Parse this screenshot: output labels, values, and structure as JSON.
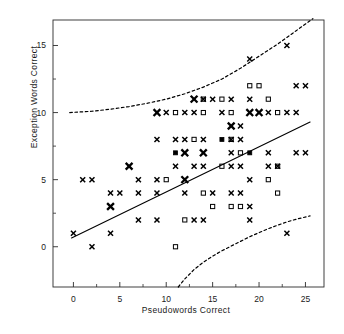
{
  "chart_data": {
    "type": "scatter",
    "title": "",
    "xlabel": "Pseudowords Correct",
    "ylabel": "Exception Words Correct",
    "xlim": [
      -2.2,
      27.0
    ],
    "ylim": [
      -3.0,
      16.9
    ],
    "xticks": [
      0,
      5,
      10,
      15,
      20,
      25
    ],
    "yticks": [
      0,
      5,
      10,
      15
    ],
    "xminorticks": [
      2.5,
      7.5,
      12.5,
      17.5,
      22.5
    ],
    "yminorticks": [
      2.5,
      7.5,
      12.5
    ],
    "grid": false,
    "legend": "none",
    "marker_colors": {
      "cross": "#000000",
      "square": "#000000"
    },
    "series": [
      {
        "name": "cross",
        "marker": "x",
        "points": [
          [
            0,
            1
          ],
          [
            4,
            1
          ],
          [
            23,
            1
          ],
          [
            2,
            0
          ],
          [
            7,
            2
          ],
          [
            9,
            2
          ],
          [
            13,
            2
          ],
          [
            14,
            2
          ],
          [
            19,
            2
          ],
          [
            4,
            3
          ],
          [
            19,
            3
          ],
          [
            4,
            4
          ],
          [
            5,
            4
          ],
          [
            7,
            4
          ],
          [
            9,
            4
          ],
          [
            12,
            4
          ],
          [
            15,
            4
          ],
          [
            17,
            4
          ],
          [
            18,
            4
          ],
          [
            1,
            5
          ],
          [
            2,
            5
          ],
          [
            7,
            5
          ],
          [
            9,
            5
          ],
          [
            12,
            5
          ],
          [
            19,
            5
          ],
          [
            6,
            6
          ],
          [
            11,
            6
          ],
          [
            13,
            6
          ],
          [
            14,
            6
          ],
          [
            17,
            6
          ],
          [
            18,
            6
          ],
          [
            21,
            6
          ],
          [
            22,
            6
          ],
          [
            12,
            7
          ],
          [
            14,
            7
          ],
          [
            17,
            7
          ],
          [
            21,
            7
          ],
          [
            24,
            7
          ],
          [
            25,
            7
          ],
          [
            9,
            8
          ],
          [
            11,
            8
          ],
          [
            12,
            8
          ],
          [
            14,
            8
          ],
          [
            17,
            8
          ],
          [
            18,
            8
          ],
          [
            17,
            9
          ],
          [
            18,
            9
          ],
          [
            9,
            10
          ],
          [
            10,
            10
          ],
          [
            12,
            10
          ],
          [
            13,
            10
          ],
          [
            16,
            10
          ],
          [
            19,
            10
          ],
          [
            20,
            10
          ],
          [
            21,
            10
          ],
          [
            23,
            10
          ],
          [
            24,
            10
          ],
          [
            13,
            11
          ],
          [
            14,
            11
          ],
          [
            15,
            11
          ],
          [
            17,
            11
          ],
          [
            19,
            11
          ],
          [
            24,
            12
          ],
          [
            25,
            12
          ],
          [
            19,
            14
          ],
          [
            23,
            15
          ]
        ]
      },
      {
        "name": "square",
        "marker": "s",
        "points": [
          [
            11,
            0
          ],
          [
            12,
            2
          ],
          [
            15,
            3
          ],
          [
            17,
            3
          ],
          [
            18,
            3
          ],
          [
            14,
            4
          ],
          [
            22,
            4
          ],
          [
            10,
            5
          ],
          [
            21,
            5
          ],
          [
            16,
            6
          ],
          [
            22,
            6
          ],
          [
            11,
            7
          ],
          [
            18,
            7
          ],
          [
            19,
            7
          ],
          [
            13,
            8
          ],
          [
            16,
            8
          ],
          [
            17,
            8
          ],
          [
            11,
            10
          ],
          [
            14,
            10
          ],
          [
            17,
            10
          ],
          [
            22,
            10
          ],
          [
            14,
            11
          ],
          [
            16,
            11
          ],
          [
            21,
            11
          ],
          [
            19,
            12
          ],
          [
            20,
            12
          ]
        ]
      }
    ],
    "lines": [
      {
        "name": "regression-line",
        "style": "solid",
        "points": [
          [
            -0.2,
            0.65
          ],
          [
            25.5,
            9.3
          ]
        ]
      },
      {
        "name": "upper-confidence-band",
        "style": "dashed",
        "points": [
          [
            -0.4,
            10.0
          ],
          [
            2,
            10.1
          ],
          [
            4,
            10.25
          ],
          [
            6,
            10.45
          ],
          [
            8,
            10.7
          ],
          [
            10,
            11.0
          ],
          [
            12,
            11.4
          ],
          [
            14,
            11.9
          ],
          [
            16,
            12.5
          ],
          [
            18,
            13.3
          ],
          [
            20,
            14.2
          ],
          [
            22,
            15.1
          ],
          [
            24,
            16.1
          ],
          [
            25.8,
            17.0
          ]
        ]
      },
      {
        "name": "lower-confidence-band",
        "style": "dashed",
        "points": [
          [
            11.3,
            -3.0
          ],
          [
            12,
            -2.4
          ],
          [
            13,
            -1.7
          ],
          [
            14,
            -1.15
          ],
          [
            15,
            -0.7
          ],
          [
            16,
            -0.3
          ],
          [
            17,
            0.05
          ],
          [
            18,
            0.4
          ],
          [
            19,
            0.75
          ],
          [
            20,
            1.05
          ],
          [
            21,
            1.35
          ],
          [
            22,
            1.6
          ],
          [
            23,
            1.85
          ],
          [
            24,
            2.05
          ],
          [
            25.5,
            2.3
          ]
        ]
      }
    ]
  },
  "axis": {
    "xtick_labels": [
      "0",
      "5",
      "10",
      "15",
      "20",
      "25"
    ],
    "ytick_labels": [
      "0",
      "5",
      "10",
      "15"
    ],
    "xaxis_title": "Pseudowords Correct",
    "yaxis_title": "Exception Words Correct"
  }
}
